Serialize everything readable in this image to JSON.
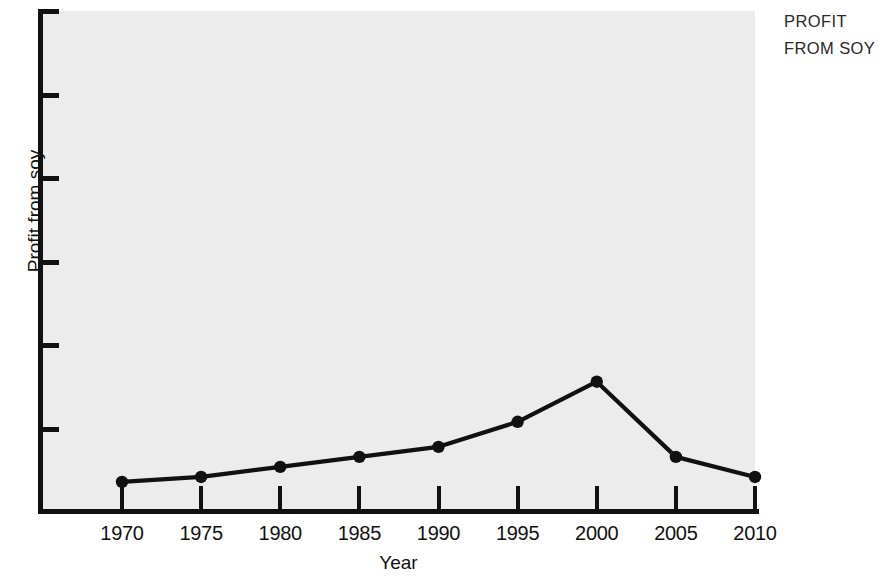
{
  "chart_data": {
    "type": "line",
    "title": "",
    "xlabel": "Year",
    "ylabel": "Profit from soy",
    "x": [
      1970,
      1975,
      1980,
      1985,
      1990,
      1995,
      2000,
      2005,
      2010
    ],
    "xticklabels": [
      "1970",
      "1975",
      "1980",
      "1985",
      "1990",
      "1995",
      "2000",
      "2005",
      "2010"
    ],
    "yticklabels": [
      "",
      "",
      "",
      "",
      "",
      ""
    ],
    "values": [
      6,
      7,
      9,
      11,
      13,
      18,
      26,
      11,
      7
    ],
    "ylim": [
      0,
      100
    ],
    "xlim": [
      1967.5,
      2012.5
    ],
    "grid": false,
    "legend": null,
    "marker": "circle",
    "line_color": "#111111",
    "plot_background": "#ececec",
    "page_background": "#ffffff",
    "annotation": {
      "line1": "PROFIT",
      "line2": "FROM SOY"
    }
  },
  "axes": {
    "y_tick_count": 6,
    "x_tick_count": 9
  }
}
